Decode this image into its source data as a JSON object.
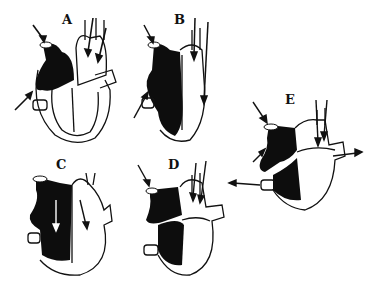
{
  "figure": {
    "panels": [
      {
        "id": "A",
        "label": "A"
      },
      {
        "id": "B",
        "label": "B"
      },
      {
        "id": "C",
        "label": "C"
      },
      {
        "id": "D",
        "label": "D"
      },
      {
        "id": "E",
        "label": "E"
      }
    ],
    "colors": {
      "ink": "#111111",
      "fill_dark": "#0d0d0d",
      "paper": "#ffffff"
    }
  }
}
